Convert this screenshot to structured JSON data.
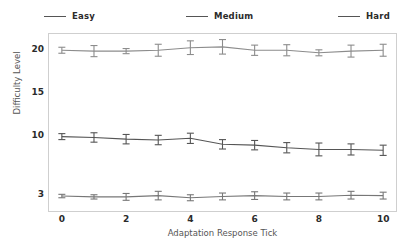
{
  "legend": {
    "items": [
      {
        "label": "Easy",
        "color": "#8c8c8c"
      },
      {
        "label": "Medium",
        "color": "#555555"
      },
      {
        "label": "Hard",
        "color": "#777777"
      }
    ]
  },
  "axes": {
    "ylabel": "Difficulty Level",
    "xlabel": "Adaptation Response Tick",
    "yticks": [
      "20",
      "15",
      "10",
      "3"
    ],
    "xticks": [
      "0",
      "2",
      "4",
      "6",
      "8",
      "10"
    ]
  },
  "chart_data": {
    "type": "line",
    "title": "",
    "xlabel": "Adaptation Response Tick",
    "ylabel": "Difficulty Level",
    "x": [
      0,
      1,
      2,
      3,
      4,
      5,
      6,
      7,
      8,
      9,
      10
    ],
    "xlim": [
      -0.4,
      10.4
    ],
    "ylim": [
      1.3,
      22.0
    ],
    "ytick_values": [
      20,
      15,
      10,
      3
    ],
    "xtick_values": [
      0,
      2,
      4,
      6,
      8,
      10
    ],
    "grid": false,
    "legend_position": "above-plot",
    "errorbars": true,
    "series": [
      {
        "name": "Easy",
        "color": "#8c8c8c",
        "values": [
          20.1,
          20.0,
          20.0,
          20.1,
          20.4,
          20.5,
          20.1,
          20.1,
          19.8,
          20.0,
          20.1
        ],
        "errors": [
          0.35,
          0.65,
          0.3,
          0.7,
          0.8,
          0.85,
          0.6,
          0.65,
          0.35,
          0.7,
          0.7
        ]
      },
      {
        "name": "Medium",
        "color": "#555555",
        "values": [
          10.0,
          9.9,
          9.7,
          9.6,
          9.8,
          9.1,
          9.0,
          8.7,
          8.5,
          8.5,
          8.4
        ],
        "errors": [
          0.35,
          0.55,
          0.55,
          0.55,
          0.6,
          0.55,
          0.55,
          0.6,
          0.75,
          0.65,
          0.6
        ]
      },
      {
        "name": "Hard",
        "color": "#777777",
        "values": [
          3.05,
          2.95,
          2.95,
          3.1,
          2.85,
          3.0,
          3.1,
          3.0,
          3.0,
          3.15,
          3.1
        ],
        "errors": [
          0.2,
          0.25,
          0.4,
          0.5,
          0.35,
          0.4,
          0.45,
          0.4,
          0.4,
          0.45,
          0.4
        ]
      }
    ]
  }
}
